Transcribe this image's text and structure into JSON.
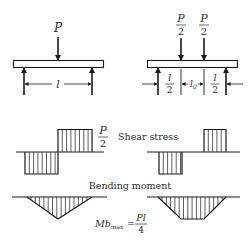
{
  "left_beam": {
    "load_label": "P",
    "span_label": "l"
  },
  "right_beam": {
    "load_labels": [
      {
        "num": "P",
        "den": "2"
      },
      {
        "num": "P",
        "den": "2"
      }
    ],
    "span_labels": [
      {
        "num": "l",
        "den": "2"
      },
      {
        "text": "l",
        "sub": "0"
      },
      {
        "num": "l",
        "den": "2"
      }
    ]
  },
  "shear": {
    "magnitude": {
      "num": "P",
      "den": "2"
    },
    "title": "Shear stress"
  },
  "bending": {
    "title": "Bending moment",
    "formula": {
      "lhs": "Mb",
      "lhs_sub": "max",
      "equals": "=",
      "num": "Pl",
      "den": "4"
    }
  },
  "colors": {
    "ink": "#1a1a1a",
    "background": "#ffffff"
  }
}
